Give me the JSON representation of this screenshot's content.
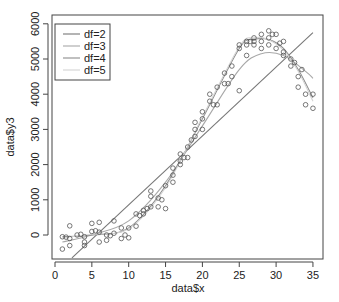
{
  "chart_data": {
    "type": "scatter",
    "title": "",
    "xlabel": "data$x",
    "ylabel": "data$y3",
    "xlim": [
      0,
      35
    ],
    "ylim": [
      -650,
      6250
    ],
    "x_ticks": [
      0,
      5,
      10,
      15,
      20,
      25,
      30,
      35
    ],
    "y_ticks": [
      0,
      1000,
      2000,
      3000,
      4000,
      5000,
      6000
    ],
    "grid": false,
    "legend": {
      "position": "top-left",
      "entries": [
        {
          "label": "df=2",
          "color": "#777777"
        },
        {
          "label": "df=3",
          "color": "#a8a8a8"
        },
        {
          "label": "df=4",
          "color": "#8c8c8c"
        },
        {
          "label": "df=5",
          "color": "#d4d4d4"
        }
      ]
    },
    "points": {
      "x": [
        1,
        1,
        2,
        2,
        2,
        3,
        4,
        4,
        4,
        5,
        5,
        6,
        6,
        6,
        7,
        7,
        8,
        8,
        9,
        9,
        10,
        10,
        11,
        11,
        12,
        12,
        13,
        13,
        13,
        14,
        14,
        15,
        15,
        16,
        16,
        16,
        17,
        17,
        17,
        18,
        18,
        19,
        19,
        19,
        20,
        20,
        20,
        21,
        21,
        22,
        22,
        23,
        23,
        24,
        24,
        25,
        25,
        25,
        26,
        26,
        26,
        27,
        27,
        27,
        28,
        28,
        28,
        29,
        29,
        29,
        30,
        30,
        31,
        31,
        31,
        32,
        32,
        33,
        33,
        34,
        34,
        35,
        35,
        1.5,
        3.5,
        5.5,
        7.5,
        9.5,
        11.5,
        12.5,
        14.5,
        17.5,
        18.5,
        21.5,
        23.5,
        26.5,
        29.5,
        30.5,
        32.5,
        33.5
      ],
      "y": [
        -50,
        -400,
        260,
        -100,
        -300,
        0,
        -50,
        -200,
        -300,
        330,
        100,
        360,
        80,
        -200,
        0,
        -150,
        400,
        50,
        200,
        -100,
        200,
        -80,
        600,
        250,
        600,
        700,
        800,
        1100,
        1250,
        800,
        1050,
        750,
        1400,
        1900,
        1700,
        1500,
        2000,
        2300,
        2100,
        2500,
        2200,
        3000,
        2800,
        3200,
        3500,
        3300,
        3000,
        4000,
        3800,
        4200,
        3700,
        4600,
        4300,
        4800,
        4500,
        5400,
        5300,
        4100,
        5500,
        5400,
        5100,
        5600,
        5500,
        5400,
        5700,
        5500,
        5300,
        5800,
        5600,
        5400,
        5300,
        5700,
        5200,
        5500,
        5100,
        5000,
        4800,
        4500,
        4200,
        4000,
        3700,
        4000,
        3600,
        -60,
        20,
        120,
        -20,
        0,
        550,
        750,
        1000,
        2200,
        2700,
        3700,
        4300,
        5500,
        5700,
        5450,
        4900,
        4700
      ]
    },
    "series": [
      {
        "name": "df=2",
        "color": "#777777",
        "kind": "linear fit",
        "x": [
          2.3,
          35
        ],
        "y": [
          -650,
          5750
        ]
      },
      {
        "name": "df=3",
        "color": "#a8a8a8",
        "kind": "smoothing spline",
        "x": [
          1,
          5,
          10,
          15,
          20,
          25,
          28,
          31,
          34,
          35
        ],
        "y": [
          -200,
          0,
          400,
          1500,
          3100,
          4700,
          5150,
          5100,
          4650,
          4450
        ]
      },
      {
        "name": "df=4",
        "color": "#8c8c8c",
        "kind": "smoothing spline",
        "x": [
          1,
          5,
          10,
          15,
          20,
          25,
          27,
          29,
          31,
          33,
          35
        ],
        "y": [
          -50,
          0,
          200,
          1400,
          3300,
          5300,
          5550,
          5550,
          5300,
          4700,
          3900
        ]
      },
      {
        "name": "df=5",
        "color": "#d4d4d4",
        "kind": "smoothing spline",
        "x": [
          1,
          5,
          10,
          15,
          20,
          25,
          27,
          29,
          31,
          33,
          35
        ],
        "y": [
          -80,
          20,
          180,
          1350,
          3350,
          5350,
          5600,
          5550,
          5250,
          4650,
          3800
        ]
      }
    ]
  },
  "axes": {
    "xlabel": "data$x",
    "ylabel": "data$y3",
    "x_tick_labels": [
      "0",
      "5",
      "10",
      "15",
      "20",
      "25",
      "30",
      "35"
    ],
    "y_tick_labels": [
      "0",
      "1000",
      "2000",
      "3000",
      "4000",
      "5000",
      "6000"
    ]
  },
  "legend": {
    "labels": [
      "df=2",
      "df=3",
      "df=4",
      "df=5"
    ]
  }
}
